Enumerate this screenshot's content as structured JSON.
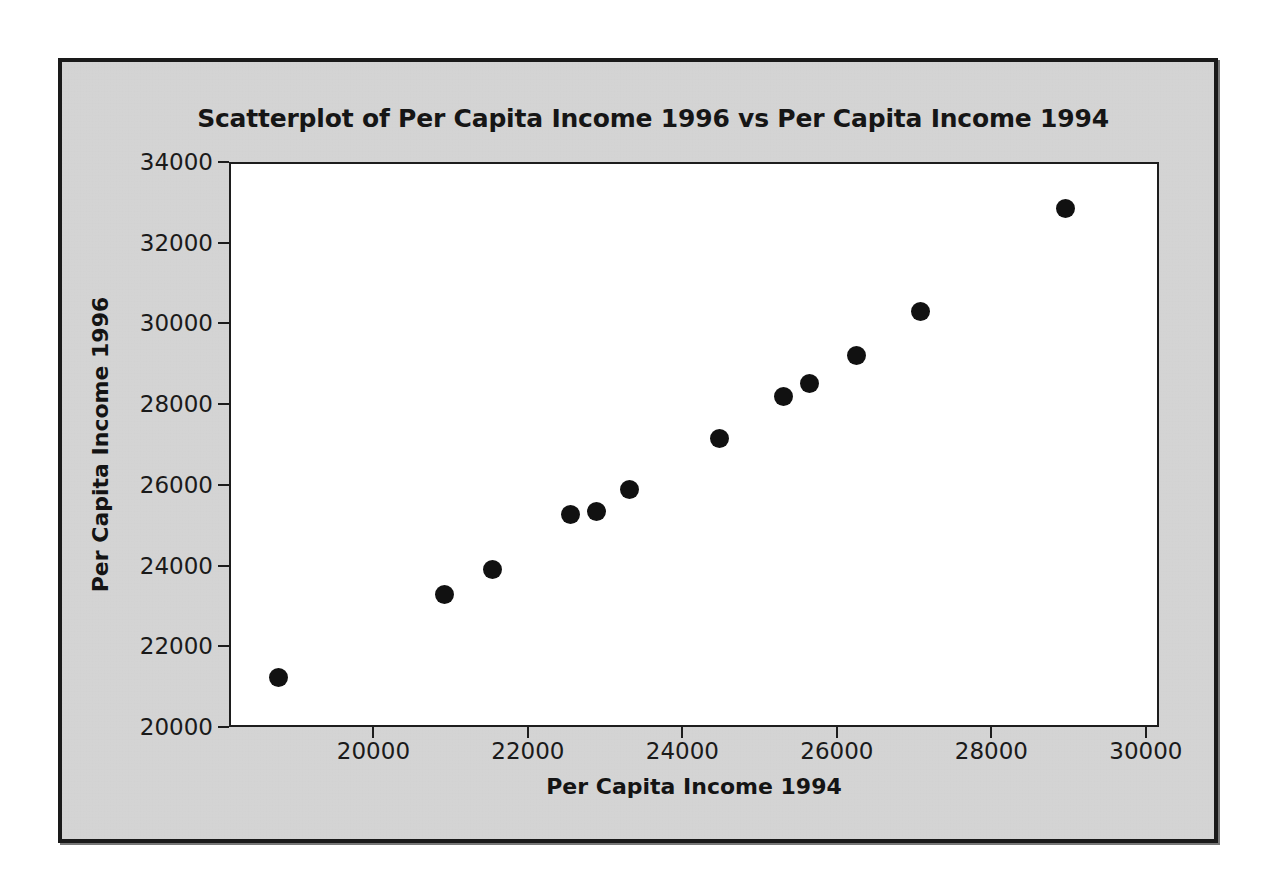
{
  "figure": {
    "background_color": "#d6d6d6",
    "frame_color": "#1a1a1a",
    "plot_background_color": "#ffffff",
    "marker_color": "#111111"
  },
  "chart_data": {
    "type": "scatter",
    "title": "Scatterplot of Per Capita Income 1996 vs Per Capita Income 1994",
    "xlabel": "Per Capita Income 1994",
    "ylabel": "Per Capita Income 1996",
    "xlim": [
      18130,
      30170
    ],
    "ylim": [
      20000,
      34000
    ],
    "xticks": [
      20000,
      22000,
      24000,
      26000,
      28000,
      30000
    ],
    "yticks": [
      20000,
      22000,
      24000,
      26000,
      28000,
      30000,
      32000,
      34000
    ],
    "xtick_labels": [
      "20000",
      "22000",
      "24000",
      "26000",
      "28000",
      "30000"
    ],
    "ytick_labels": [
      "20000",
      "22000",
      "24000",
      "26000",
      "28000",
      "30000",
      "32000",
      "34000"
    ],
    "grid": false,
    "legend": null,
    "marker": "filled-circle",
    "n_points": 12,
    "points": [
      {
        "x": 18740,
        "y": 21270
      },
      {
        "x": 20900,
        "y": 23330
      },
      {
        "x": 21520,
        "y": 23960
      },
      {
        "x": 22520,
        "y": 25320
      },
      {
        "x": 22860,
        "y": 25400
      },
      {
        "x": 23290,
        "y": 25930
      },
      {
        "x": 24450,
        "y": 27190
      },
      {
        "x": 25280,
        "y": 28230
      },
      {
        "x": 25620,
        "y": 28570
      },
      {
        "x": 26230,
        "y": 29250
      },
      {
        "x": 27060,
        "y": 30350
      },
      {
        "x": 28940,
        "y": 32900
      }
    ]
  }
}
